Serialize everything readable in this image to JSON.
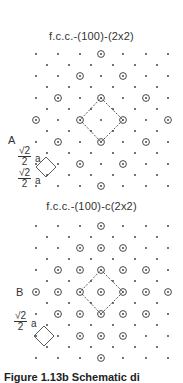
{
  "panels": [
    {
      "label": "A",
      "title": "f.c.c.-(100)-(2x2)",
      "fraction": {
        "numerator": "√2",
        "denominator": "2",
        "unit": "a"
      }
    },
    {
      "label": "B",
      "title": "f.c.c.-(100)-c(2x2)",
      "fraction": {
        "numerator": "√2",
        "denominator": "2",
        "unit": "a"
      }
    }
  ],
  "caption": "Figure 1.13b Schematic di",
  "colors": {
    "ink": "#333333",
    "background": "#ffffff"
  }
}
